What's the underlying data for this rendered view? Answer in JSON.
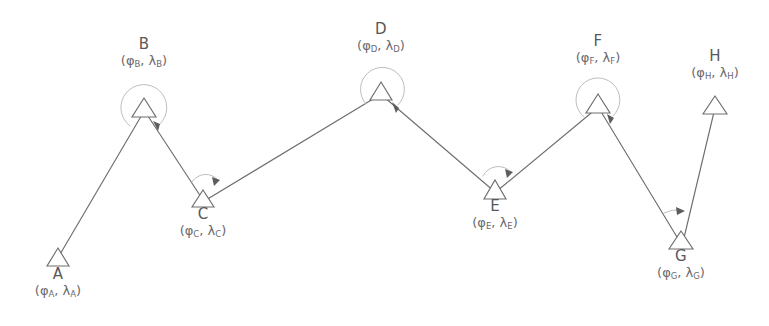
{
  "diagram": {
    "type": "survey-traverse",
    "background_color": "#ffffff",
    "line_color": "#6e6e70",
    "arc_color": "#b6b6b8",
    "text_color": "#58585a",
    "canvas": {
      "width": 769,
      "height": 326
    }
  },
  "stations": [
    {
      "id": "A",
      "name": "A",
      "coords_label": "(φ",
      "coords_sub1": "A",
      "coords_mid": ", λ",
      "coords_sub2": "A",
      "coords_end": ")",
      "x": 58,
      "y": 258,
      "label_x": 58,
      "label_y": 266,
      "label_position": "below",
      "has_angle_arc": false
    },
    {
      "id": "B",
      "name": "B",
      "coords_label": "(φ",
      "coords_sub1": "B",
      "coords_mid": ", λ",
      "coords_sub2": "B",
      "coords_end": ")",
      "x": 144,
      "y": 108,
      "label_x": 144,
      "label_y": 36,
      "label_position": "above",
      "has_angle_arc": true,
      "arc_type": "full",
      "arc_radius": 23
    },
    {
      "id": "C",
      "name": "C",
      "coords_label": "(φ",
      "coords_sub1": "C",
      "coords_mid": ", λ",
      "coords_sub2": "C",
      "coords_end": ")",
      "x": 203,
      "y": 198,
      "label_x": 203,
      "label_y": 206,
      "label_position": "below",
      "has_angle_arc": true,
      "arc_type": "partial",
      "arc_radius": 16
    },
    {
      "id": "D",
      "name": "D",
      "coords_label": "(φ",
      "coords_sub1": "D",
      "coords_mid": ", λ",
      "coords_sub2": "D",
      "coords_end": ")",
      "x": 381,
      "y": 92,
      "label_x": 381,
      "label_y": 21,
      "label_position": "above",
      "has_angle_arc": true,
      "arc_type": "full",
      "arc_radius": 22
    },
    {
      "id": "E",
      "name": "E",
      "coords_label": "(φ",
      "coords_sub1": "E",
      "coords_mid": ", λ",
      "coords_sub2": "E",
      "coords_end": ")",
      "x": 495,
      "y": 190,
      "label_x": 495,
      "label_y": 198,
      "label_position": "below",
      "has_angle_arc": true,
      "arc_type": "partial",
      "arc_radius": 17
    },
    {
      "id": "F",
      "name": "F",
      "coords_label": "(φ",
      "coords_sub1": "F",
      "coords_mid": ", λ",
      "coords_sub2": "F",
      "coords_end": ")",
      "x": 598,
      "y": 104,
      "label_x": 598,
      "label_y": 33,
      "label_position": "above",
      "has_angle_arc": true,
      "arc_type": "full",
      "arc_radius": 22
    },
    {
      "id": "G",
      "name": "G",
      "coords_label": "(φ",
      "coords_sub1": "G",
      "coords_mid": ", λ",
      "coords_sub2": "G",
      "coords_end": ")",
      "x": 681,
      "y": 240,
      "label_x": 681,
      "label_y": 248,
      "label_position": "below",
      "has_angle_arc": true,
      "arc_type": "narrow",
      "arc_radius": 30
    },
    {
      "id": "H",
      "name": "H",
      "coords_label": "(φ",
      "coords_sub1": "H",
      "coords_mid": ", λ",
      "coords_sub2": "H",
      "coords_end": ")",
      "x": 715,
      "y": 106,
      "label_x": 715,
      "label_y": 48,
      "label_position": "above",
      "has_angle_arc": false
    }
  ],
  "legs": [
    {
      "from": "A",
      "to": "B"
    },
    {
      "from": "B",
      "to": "C"
    },
    {
      "from": "C",
      "to": "D"
    },
    {
      "from": "D",
      "to": "E"
    },
    {
      "from": "E",
      "to": "F"
    },
    {
      "from": "F",
      "to": "G"
    },
    {
      "from": "G",
      "to": "H"
    }
  ]
}
